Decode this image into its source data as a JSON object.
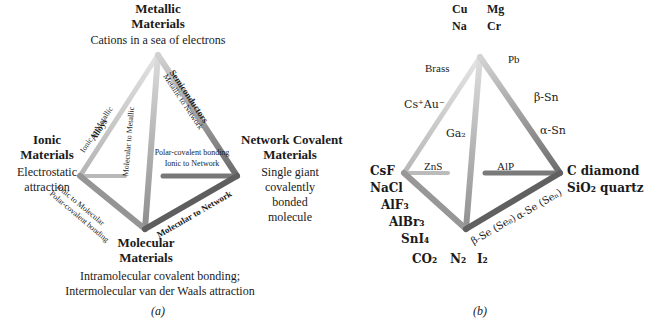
{
  "figure": {
    "panel_a_letter": "(a)",
    "panel_b_letter": "(b)"
  },
  "colors": {
    "edge_light": "#c9c9c9",
    "edge_mid": "#9a9a9a",
    "edge_dark": "#6e6e6e",
    "edge_darker": "#585858",
    "text": "#1a1a1a"
  },
  "panel_a": {
    "vertices": {
      "metallic": {
        "title_line1": "Metallic",
        "title_line2": "Materials",
        "description": "Cations in a sea of electrons"
      },
      "ionic": {
        "title_line1": "Ionic",
        "title_line2": "Materials",
        "desc_line1": "Electrostatic",
        "desc_line2": "attraction"
      },
      "network": {
        "title_line1": "Network Covalent",
        "title_line2": "Materials",
        "desc_line1": "Single giant",
        "desc_line2": "covalently",
        "desc_line3": "bonded",
        "desc_line4": "molecule"
      },
      "molecular": {
        "title_line1": "Molecular",
        "title_line2": "Materials",
        "desc_line1": "Intramolecular covalent bonding;",
        "desc_line2": "Intermolecular van der Waals attraction"
      }
    },
    "edges": [
      {
        "name": "alloys",
        "line1": "Alloys",
        "line2": "Ionic to Metallic"
      },
      {
        "name": "molecular-metallic",
        "line1": "",
        "line2": "Molecular to Metallic"
      },
      {
        "name": "semiconductors",
        "line1": "Semiconductors",
        "line2": "Metallic to Network"
      },
      {
        "name": "polar-covalent",
        "line1": "Polar-covalent bonding",
        "line2": "Ionic to Network"
      },
      {
        "name": "ionic-molecular",
        "line1": "Ionic to Molecular",
        "line2": "Polar-covalent bonding"
      },
      {
        "name": "molecular-network",
        "line1": "",
        "line2": "Molecular to Network"
      }
    ]
  },
  "panel_b": {
    "apex_labels": [
      "Cu",
      "Mg",
      "Na",
      "Cr"
    ],
    "examples": {
      "brass": "Brass",
      "cs_au": "Cs⁺Au⁻",
      "ga2": "Ga₂",
      "pb": "Pb",
      "beta_sn": "β-Sn",
      "alpha_sn": "α-Sn",
      "zns": "ZnS",
      "alp": "AlP",
      "beta_se": "β-Se (Se₈)",
      "alpha_se": "α-Se (Seₙ)"
    },
    "left_vertex": [
      "CsF",
      "NaCl",
      "AlF₃",
      "AlBr₃",
      "SnI₄"
    ],
    "bottom_vertex": [
      "CO₂",
      "N₂",
      "I₂"
    ],
    "right_vertex": [
      "C diamond",
      "SiO₂ quartz"
    ]
  }
}
